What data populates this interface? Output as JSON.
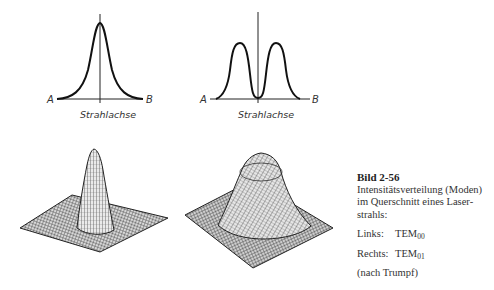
{
  "figure": {
    "top_left": {
      "left_label": "A",
      "right_label": "B",
      "axis_label": "Strahlachse",
      "profile": "single-peak gaussian"
    },
    "top_right": {
      "left_label": "A",
      "right_label": "B",
      "axis_label": "Strahlachse",
      "profile": "double-peak with central dip"
    },
    "bottom_left": {
      "description": "3D wireframe intensity surface, single central peak (TEM00)"
    },
    "bottom_right": {
      "description": "3D wireframe intensity surface, ring/donut mode (TEM01)"
    }
  },
  "caption": {
    "title": "Bild 2-56",
    "text": "Intensitätsverteilung (Moden) im Querschnitt eines Laser-strahls:",
    "links_label": "Links:",
    "links_mode": "TEM",
    "links_sub": "00",
    "rechts_label": "Rechts:",
    "rechts_mode": "TEM",
    "rechts_sub": "01",
    "source": "(nach Trumpf)"
  }
}
